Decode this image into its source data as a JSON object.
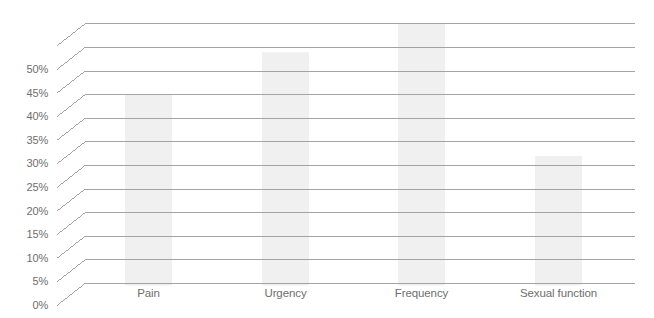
{
  "chart_data": {
    "type": "bar",
    "title": "",
    "subtitle": "",
    "xlabel": "",
    "ylabel": "",
    "categories": [
      "Pain",
      "Urgency",
      "Frequency",
      "Sexual function"
    ],
    "values": [
      40,
      49,
      55,
      27
    ],
    "value_labels": [
      "40%",
      "49%",
      "55%",
      "27%"
    ],
    "ylim": [
      0,
      55
    ],
    "ytick_values": [
      0,
      5,
      10,
      15,
      20,
      25,
      30,
      35,
      40,
      45,
      50,
      55
    ],
    "ytick_labels": [
      "0%",
      "5%",
      "10%",
      "15%",
      "20%",
      "25%",
      "30%",
      "35%",
      "40%",
      "45%",
      "50%",
      ""
    ],
    "grid": true,
    "grid_axis": "y",
    "legend": null,
    "legend_position": "none",
    "annotations": [],
    "series": [
      {
        "name": "Symptom improvement",
        "values": [
          40,
          49,
          55,
          27
        ]
      }
    ],
    "style": {
      "bar_color": "#f0f0f0",
      "grid_color": "#9a9a9a",
      "axis_label_color": "#6e6e6e",
      "background": "#ffffff",
      "perspective_leader": true
    }
  },
  "axis": {
    "y_ticks": [
      {
        "label": "0%",
        "value": 0
      },
      {
        "label": "5%",
        "value": 5
      },
      {
        "label": "10%",
        "value": 10
      },
      {
        "label": "15%",
        "value": 15
      },
      {
        "label": "20%",
        "value": 20
      },
      {
        "label": "25%",
        "value": 25
      },
      {
        "label": "30%",
        "value": 30
      },
      {
        "label": "35%",
        "value": 35
      },
      {
        "label": "40%",
        "value": 40
      },
      {
        "label": "45%",
        "value": 45
      },
      {
        "label": "50%",
        "value": 50
      },
      {
        "label": "",
        "value": 55
      }
    ],
    "x_ticks": [
      {
        "label": "Pain"
      },
      {
        "label": "Urgency"
      },
      {
        "label": "Frequency"
      },
      {
        "label": "Sexual function"
      }
    ]
  }
}
